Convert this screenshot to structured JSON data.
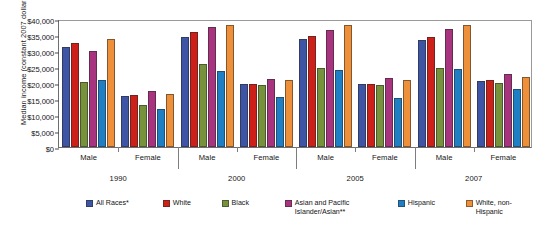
{
  "chart_data": {
    "type": "bar",
    "title": "",
    "xlabel": "",
    "ylabel": "Median income (constant 2007 dollars)",
    "ylim": [
      0,
      40000
    ],
    "ytick_labels": [
      "$0",
      "$5,000",
      "$10,000",
      "$15,000",
      "$20,000",
      "$25,000",
      "$30,000",
      "$35,000",
      "$40,000"
    ],
    "ytick_values": [
      0,
      5000,
      10000,
      15000,
      20000,
      25000,
      30000,
      35000,
      40000
    ],
    "grid": false,
    "legend_position": "bottom",
    "years": [
      "1990",
      "2000",
      "2005",
      "2007"
    ],
    "sexes": [
      "Male",
      "Female"
    ],
    "categories": [
      "1990 Male",
      "1990 Female",
      "2000 Male",
      "2000 Female",
      "2005 Male",
      "2005 Female",
      "2007 Male",
      "2007 Female"
    ],
    "series": [
      {
        "name": "All Races*",
        "color": "#3d55a4",
        "values": [
          31300,
          15800,
          34300,
          19700,
          33700,
          19800,
          33500,
          20600
        ]
      },
      {
        "name": "White",
        "color": "#cc2019",
        "values": [
          32600,
          16400,
          35900,
          19700,
          34600,
          19600,
          34500,
          20800
        ]
      },
      {
        "name": "Black",
        "color": "#76933c",
        "values": [
          20400,
          13000,
          26000,
          19400,
          24700,
          19300,
          24700,
          19900
        ]
      },
      {
        "name": "Asian and Pacific\nIslander/Asian**",
        "color": "#a8337f",
        "values": [
          30100,
          17400,
          37600,
          21400,
          36600,
          21700,
          36900,
          22700
        ]
      },
      {
        "name": "Hispanic",
        "color": "#1f7fc4",
        "values": [
          20900,
          12000,
          23800,
          15500,
          24200,
          15300,
          24300,
          18000
        ]
      },
      {
        "name": "White, non-Hispanic",
        "color": "#ed9039",
        "values": [
          33800,
          16500,
          38200,
          20900,
          38200,
          20800,
          38000,
          22000
        ]
      }
    ]
  }
}
